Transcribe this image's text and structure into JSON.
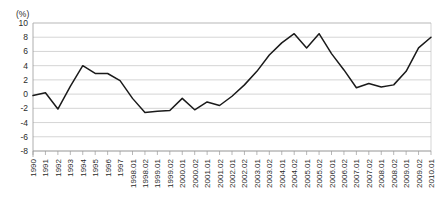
{
  "chart_data": {
    "type": "line",
    "title": "",
    "subtitle": "",
    "unit_label": "(%)",
    "xlabel": "",
    "ylabel": "",
    "ylim": [
      -8,
      10
    ],
    "ytick_step": 2,
    "ytick_labels": [
      "10",
      "8",
      "6",
      "4",
      "2",
      "0",
      "-2",
      "-4",
      "-6",
      "-8"
    ],
    "ytick_values": [
      10,
      8,
      6,
      4,
      2,
      0,
      -2,
      -4,
      -6,
      -8
    ],
    "grid": true,
    "legend": false,
    "legend_position": "none",
    "categories": [
      "1990",
      "1991",
      "1992",
      "1993",
      "1994",
      "1995",
      "1996",
      "1997",
      "1998.01",
      "1998.02",
      "1999.01",
      "1999.02",
      "2000.01",
      "2000.02",
      "2001.01",
      "2001.02",
      "2002.01",
      "2002.02",
      "2003.01",
      "2003.02",
      "2004.01",
      "2004.02",
      "2005.01",
      "2005.02",
      "2006.01",
      "2006.02",
      "2007.01",
      "2007.02",
      "2008.01",
      "2008.02",
      "2009.01",
      "2009.02",
      "2010.01"
    ],
    "values": [
      -0.2,
      0.2,
      -2.1,
      1.1,
      4.0,
      2.9,
      2.9,
      1.9,
      -0.6,
      -2.6,
      -2.4,
      -2.3,
      -0.6,
      -2.2,
      -1.1,
      -1.6,
      -0.3,
      1.3,
      3.2,
      5.5,
      7.2,
      8.5,
      6.5,
      8.5,
      5.7,
      3.4,
      0.9,
      1.5,
      1.0,
      1.3,
      3.2,
      6.5,
      8.0
    ],
    "series": [
      {
        "name": "growth-rate",
        "color": "#1a1a1a",
        "values": [
          -0.2,
          0.2,
          -2.1,
          1.1,
          4.0,
          2.9,
          2.9,
          1.9,
          -0.6,
          -2.6,
          -2.4,
          -2.3,
          -0.6,
          -2.2,
          -1.1,
          -1.6,
          -0.3,
          1.3,
          3.2,
          5.5,
          7.2,
          8.5,
          6.5,
          8.5,
          5.7,
          3.4,
          0.9,
          1.5,
          1.0,
          1.3,
          3.2,
          6.5,
          8.0
        ]
      }
    ]
  },
  "colors": {
    "line": "#1a1a1a",
    "grid": "#b9b9b9",
    "text": "#2b2b2b",
    "background": "#ffffff"
  }
}
